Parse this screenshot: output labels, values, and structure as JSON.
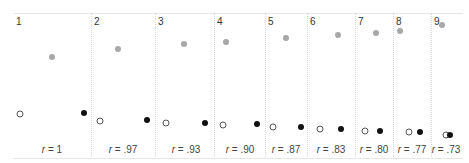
{
  "chart_data": {
    "type": "scatter",
    "title": "",
    "panels": [
      {
        "id": "1",
        "r_label": "r = 1",
        "r": 1.0,
        "grey": [
          52,
          57
        ],
        "open": [
          20,
          114
        ],
        "filled": [
          84,
          113
        ]
      },
      {
        "id": "2",
        "r_label": "r = .97",
        "r": 0.97,
        "grey": [
          118,
          49
        ],
        "open": [
          100,
          121
        ],
        "filled": [
          147,
          120
        ]
      },
      {
        "id": "3",
        "r_label": "r = .93",
        "r": 0.93,
        "grey": [
          184,
          44
        ],
        "open": [
          166,
          123
        ],
        "filled": [
          205,
          123
        ]
      },
      {
        "id": "4",
        "r_label": "r = .90",
        "r": 0.9,
        "grey": [
          226,
          42
        ],
        "open": [
          223,
          125
        ],
        "filled": [
          257,
          124
        ]
      },
      {
        "id": "5",
        "r_label": "r = .87",
        "r": 0.87,
        "grey": [
          286,
          38
        ],
        "open": [
          273,
          127
        ],
        "filled": [
          301,
          127
        ]
      },
      {
        "id": "6",
        "r_label": "r = .83",
        "r": 0.83,
        "grey": [
          338,
          35
        ],
        "open": [
          320,
          129
        ],
        "filled": [
          341,
          129
        ]
      },
      {
        "id": "7",
        "r_label": "r = .80",
        "r": 0.8,
        "grey": [
          376,
          33
        ],
        "open": [
          365,
          131
        ],
        "filled": [
          380,
          131
        ]
      },
      {
        "id": "8",
        "r_label": "r = .77",
        "r": 0.77,
        "grey": [
          400,
          31
        ],
        "open": [
          409,
          132
        ],
        "filled": [
          420,
          132
        ]
      },
      {
        "id": "9",
        "r_label": "r = .73",
        "r": 0.73,
        "grey": [
          442,
          25
        ],
        "open": [
          446,
          135
        ],
        "filled": [
          450,
          135
        ]
      }
    ],
    "separators_x": [
      91,
      155,
      214,
      265,
      307,
      355,
      393,
      431
    ],
    "panel_label_x": [
      16,
      94,
      158,
      217,
      268,
      310,
      358,
      396,
      434
    ],
    "r_label_x": [
      52,
      123,
      186,
      240,
      286,
      331,
      374,
      412,
      446
    ],
    "grid": false,
    "legend": null,
    "colors": {
      "grey": "#a8a8a8",
      "open_stroke": "#555555",
      "filled": "#111111"
    }
  }
}
